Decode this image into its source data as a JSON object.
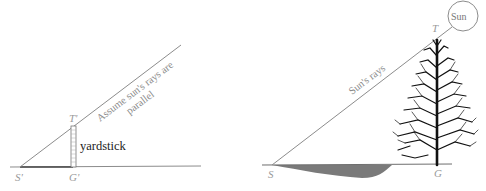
{
  "left_figure": {
    "points": {
      "shadow_tip": "S'",
      "stick_top": "T'",
      "stick_base": "G'"
    },
    "object_label": "yardstick",
    "ray_label_line1": "Assume sun's rays are",
    "ray_label_line2": "parallel"
  },
  "right_figure": {
    "points": {
      "shadow_tip": "S",
      "tree_top": "T",
      "tree_base": "G"
    },
    "ray_label": "Sun's rays",
    "sun_label": "Sun"
  },
  "colors": {
    "line": "#8c8c8c",
    "ground": "#6e6e6e",
    "shadow": "#7a7a7a",
    "tree": "#111111"
  }
}
